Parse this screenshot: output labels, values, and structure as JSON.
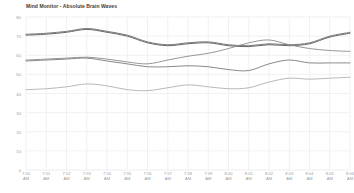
{
  "chart_data": {
    "type": "line",
    "title": "Mind Monitor - Absolute Brain Waves",
    "xlabel": "",
    "ylabel": "",
    "ylim": [
      0,
      80
    ],
    "ytick_step": 10,
    "yticks": [
      80,
      70,
      60,
      50,
      40,
      30,
      20,
      10,
      0
    ],
    "grid": true,
    "legend": "none",
    "x": [
      "7:50 AM",
      "7:51 AM",
      "7:52 AM",
      "7:53 AM",
      "7:54 AM",
      "7:55 AM",
      "7:56 AM",
      "7:57 AM",
      "7:58 AM",
      "7:59 AM",
      "8:00 AM",
      "8:01 AM",
      "8:02 AM",
      "8:03 AM",
      "8:04 AM",
      "8:05 AM",
      "8:06 AM"
    ],
    "xticks": [
      {
        "time": "7:50",
        "meridiem": "AM"
      },
      {
        "time": "7:51",
        "meridiem": "AM"
      },
      {
        "time": "7:52",
        "meridiem": "AM"
      },
      {
        "time": "7:53",
        "meridiem": "AM"
      },
      {
        "time": "7:54",
        "meridiem": "AM"
      },
      {
        "time": "7:55",
        "meridiem": "AM"
      },
      {
        "time": "7:56",
        "meridiem": "AM"
      },
      {
        "time": "7:57",
        "meridiem": "AM"
      },
      {
        "time": "7:58",
        "meridiem": "AM"
      },
      {
        "time": "7:59",
        "meridiem": "AM"
      },
      {
        "time": "8:00",
        "meridiem": "AM"
      },
      {
        "time": "8:01",
        "meridiem": "AM"
      },
      {
        "time": "8:02",
        "meridiem": "AM"
      },
      {
        "time": "8:03",
        "meridiem": "AM"
      },
      {
        "time": "8:04",
        "meridiem": "AM"
      },
      {
        "time": "8:05",
        "meridiem": "AM"
      },
      {
        "time": "8:06",
        "meridiem": "AM"
      }
    ],
    "series": [
      {
        "name": "wave-1",
        "color": "#6d6d6d",
        "values": [
          71,
          71.5,
          72.5,
          74,
          72.5,
          70.5,
          67,
          65.5,
          66.5,
          67,
          65.5,
          65,
          66,
          65.5,
          66.5,
          70,
          72
        ]
      },
      {
        "name": "wave-2",
        "color": "#585858",
        "values": [
          70.5,
          71,
          72,
          73.5,
          72,
          70,
          66.5,
          65,
          66,
          66.5,
          65,
          64.5,
          65.5,
          65,
          66,
          69.5,
          71.5
        ]
      },
      {
        "name": "wave-3",
        "color": "#8a8a8a",
        "values": [
          57.5,
          58,
          58.5,
          59,
          58,
          56.5,
          55.5,
          57.5,
          59.5,
          61,
          63.5,
          66.5,
          68,
          65.5,
          63.5,
          62.5,
          62
        ]
      },
      {
        "name": "wave-4",
        "color": "#7a7a7a",
        "values": [
          57,
          57.5,
          58,
          58.5,
          57,
          55.5,
          54,
          54,
          54.5,
          54,
          52.5,
          52,
          55.5,
          57.5,
          56,
          56,
          56
        ]
      },
      {
        "name": "wave-5",
        "color": "#b0b0b0",
        "values": [
          42,
          42.5,
          43.5,
          45,
          44,
          42,
          41.5,
          43,
          44.5,
          43.5,
          42.5,
          43,
          46,
          48,
          47.5,
          48,
          48.5
        ]
      }
    ],
    "colors": {
      "background": "#ffffff",
      "grid": "#ededed",
      "axis_text": "#9a9a9a",
      "title_text": "#3a3a3a"
    }
  }
}
